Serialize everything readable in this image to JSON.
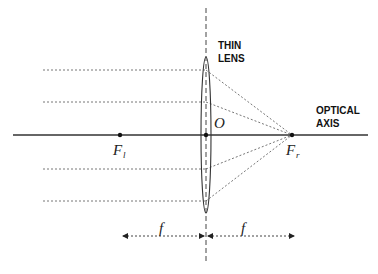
{
  "diagram": {
    "labels": {
      "lens_line1": "THIN",
      "lens_line2": "LENS",
      "axis_line1": "OPTICAL",
      "axis_line2": "AXIS",
      "origin": "O",
      "focal_left_main": "F",
      "focal_left_sub": "l",
      "focal_right_main": "F",
      "focal_right_sub": "r",
      "focal_length_left": "f",
      "focal_length_right": "f"
    },
    "colors": {
      "line": "#333333",
      "ray": "#777777",
      "background": "#ffffff"
    },
    "geometry": {
      "optical_axis_y": 135,
      "lens_center_x": 206,
      "lens_top_y": 57,
      "lens_bottom_y": 213,
      "focal_left_x": 120,
      "focal_right_x": 292,
      "ray_start_x": 43,
      "ray_y": [
        70,
        102,
        169,
        201
      ],
      "focal_arrow_y": 236
    }
  }
}
